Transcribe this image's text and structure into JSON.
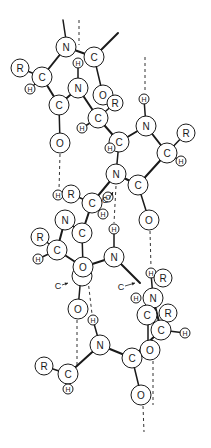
{
  "diagram": {
    "title": "",
    "bond_color": "#1a1a1a",
    "background": "#ffffff"
  },
  "atoms": [
    {
      "id": "n1",
      "label": "N",
      "x": 66,
      "y": 47,
      "r": 10
    },
    {
      "id": "c1",
      "label": "C",
      "x": 94,
      "y": 57,
      "r": 10
    },
    {
      "id": "r1",
      "label": "R",
      "x": 20,
      "y": 68,
      "r": 9
    },
    {
      "id": "ca1",
      "label": "C",
      "x": 42,
      "y": 77,
      "r": 10
    },
    {
      "id": "h1",
      "label": "H",
      "x": 30,
      "y": 89,
      "r": 5
    },
    {
      "id": "h2",
      "label": "H",
      "x": 78,
      "y": 63,
      "r": 5
    },
    {
      "id": "n2",
      "label": "N",
      "x": 78,
      "y": 88,
      "r": 10
    },
    {
      "id": "c2",
      "label": "C",
      "x": 59,
      "y": 105,
      "r": 10
    },
    {
      "id": "o1",
      "label": "O",
      "x": 103,
      "y": 95,
      "r": 10
    },
    {
      "id": "r2",
      "label": "R",
      "x": 115,
      "y": 103,
      "r": 8
    },
    {
      "id": "ca2",
      "label": "C",
      "x": 98,
      "y": 118,
      "r": 10
    },
    {
      "id": "h3",
      "label": "H",
      "x": 82,
      "y": 128,
      "r": 5
    },
    {
      "id": "o2",
      "label": "O",
      "x": 60,
      "y": 143,
      "r": 10
    },
    {
      "id": "c3",
      "label": "C",
      "x": 119,
      "y": 142,
      "r": 10
    },
    {
      "id": "h4",
      "label": "H",
      "x": 110,
      "y": 148,
      "r": 5
    },
    {
      "id": "h5",
      "label": "H",
      "x": 144,
      "y": 99,
      "r": 5
    },
    {
      "id": "n3",
      "label": "N",
      "x": 146,
      "y": 126,
      "r": 10
    },
    {
      "id": "r3",
      "label": "R",
      "x": 186,
      "y": 133,
      "r": 9
    },
    {
      "id": "ca3",
      "label": "C",
      "x": 167,
      "y": 153,
      "r": 10
    },
    {
      "id": "h6",
      "label": "H",
      "x": 181,
      "y": 161,
      "r": 5
    },
    {
      "id": "n4",
      "label": "N",
      "x": 116,
      "y": 174,
      "r": 10
    },
    {
      "id": "c4",
      "label": "C",
      "x": 138,
      "y": 185,
      "r": 10
    },
    {
      "id": "o3",
      "label": "O",
      "x": 149,
      "y": 220,
      "r": 10
    },
    {
      "id": "h7",
      "label": "H",
      "x": 58,
      "y": 195,
      "r": 5
    },
    {
      "id": "r4",
      "label": "R",
      "x": 71,
      "y": 194,
      "r": 9
    },
    {
      "id": "ca4",
      "label": "C",
      "x": 92,
      "y": 203,
      "r": 10
    },
    {
      "id": "o4",
      "label": "O",
      "x": 108,
      "y": 197,
      "r": 5
    },
    {
      "id": "h8",
      "label": "H",
      "x": 103,
      "y": 214,
      "r": 5
    },
    {
      "id": "n5",
      "label": "N",
      "x": 65,
      "y": 220,
      "r": 10
    },
    {
      "id": "c5",
      "label": "C",
      "x": 82,
      "y": 233,
      "r": 10
    },
    {
      "id": "h9",
      "label": "H",
      "x": 114,
      "y": 229,
      "r": 5
    },
    {
      "id": "r5",
      "label": "R",
      "x": 40,
      "y": 237,
      "r": 9
    },
    {
      "id": "ca5",
      "label": "C",
      "x": 57,
      "y": 250,
      "r": 10
    },
    {
      "id": "h10",
      "label": "H",
      "x": 38,
      "y": 259,
      "r": 5
    },
    {
      "id": "n6",
      "label": "N",
      "x": 114,
      "y": 257,
      "r": 10
    },
    {
      "id": "o5b",
      "label": "",
      "x": 82,
      "y": 276,
      "r": 10
    },
    {
      "id": "o5",
      "label": "O",
      "x": 83,
      "y": 267,
      "r": 10
    },
    {
      "id": "h11",
      "label": "H",
      "x": 151,
      "y": 273,
      "r": 5
    },
    {
      "id": "r6",
      "label": "R",
      "x": 163,
      "y": 278,
      "r": 9
    },
    {
      "id": "h12",
      "label": "H",
      "x": 136,
      "y": 298,
      "r": 5
    },
    {
      "id": "n7",
      "label": "N",
      "x": 153,
      "y": 298,
      "r": 10
    },
    {
      "id": "c6",
      "label": "C",
      "x": 147,
      "y": 315,
      "r": 10
    },
    {
      "id": "r7",
      "label": "R",
      "x": 168,
      "y": 313,
      "r": 9
    },
    {
      "id": "ca6",
      "label": "C",
      "x": 161,
      "y": 330,
      "r": 10
    },
    {
      "id": "h13",
      "label": "H",
      "x": 185,
      "y": 333,
      "r": 5
    },
    {
      "id": "o6",
      "label": "O",
      "x": 78,
      "y": 309,
      "r": 10
    },
    {
      "id": "h14",
      "label": "H",
      "x": 93,
      "y": 320,
      "r": 5
    },
    {
      "id": "n8",
      "label": "N",
      "x": 100,
      "y": 345,
      "r": 10
    },
    {
      "id": "o7",
      "label": "O",
      "x": 150,
      "y": 350,
      "r": 10
    },
    {
      "id": "c7",
      "label": "C",
      "x": 132,
      "y": 358,
      "r": 10
    },
    {
      "id": "r8",
      "label": "R",
      "x": 44,
      "y": 366,
      "r": 9
    },
    {
      "id": "ca7",
      "label": "C",
      "x": 68,
      "y": 374,
      "r": 10
    },
    {
      "id": "h15",
      "label": "H",
      "x": 68,
      "y": 389,
      "r": 5
    },
    {
      "id": "o8",
      "label": "O",
      "x": 141,
      "y": 395,
      "r": 10
    }
  ],
  "bonds": [
    {
      "from": [
        63,
        20
      ],
      "to": [
        66,
        40
      ],
      "thick": false
    },
    {
      "from": [
        66,
        47
      ],
      "to": [
        94,
        57
      ],
      "thick": true
    },
    {
      "from": [
        94,
        57
      ],
      "to": [
        118,
        33
      ],
      "thick": true
    },
    {
      "from": [
        66,
        47
      ],
      "to": [
        42,
        77
      ],
      "thick": true
    },
    {
      "from": [
        20,
        68
      ],
      "to": [
        42,
        77
      ],
      "thick": false
    },
    {
      "from": [
        42,
        77
      ],
      "to": [
        30,
        89
      ],
      "thick": false
    },
    {
      "from": [
        42,
        77
      ],
      "to": [
        59,
        105
      ],
      "thick": true
    },
    {
      "from": [
        59,
        105
      ],
      "to": [
        60,
        143
      ],
      "thick": false
    },
    {
      "from": [
        94,
        57
      ],
      "to": [
        103,
        95
      ],
      "thick": false
    },
    {
      "from": [
        78,
        63
      ],
      "to": [
        78,
        88
      ],
      "thick": false
    },
    {
      "from": [
        78,
        88
      ],
      "to": [
        59,
        105
      ],
      "thick": true
    },
    {
      "from": [
        78,
        88
      ],
      "to": [
        98,
        118
      ],
      "thick": true
    },
    {
      "from": [
        98,
        118
      ],
      "to": [
        115,
        103
      ],
      "thick": false
    },
    {
      "from": [
        98,
        118
      ],
      "to": [
        82,
        128
      ],
      "thick": false
    },
    {
      "from": [
        98,
        118
      ],
      "to": [
        119,
        142
      ],
      "thick": true
    },
    {
      "from": [
        119,
        142
      ],
      "to": [
        146,
        126
      ],
      "thick": true
    },
    {
      "from": [
        144,
        99
      ],
      "to": [
        146,
        126
      ],
      "thick": false
    },
    {
      "from": [
        146,
        126
      ],
      "to": [
        167,
        153
      ],
      "thick": true
    },
    {
      "from": [
        167,
        153
      ],
      "to": [
        186,
        133
      ],
      "thick": false
    },
    {
      "from": [
        167,
        153
      ],
      "to": [
        181,
        161
      ],
      "thick": false
    },
    {
      "from": [
        167,
        153
      ],
      "to": [
        138,
        185
      ],
      "thick": true
    },
    {
      "from": [
        119,
        142
      ],
      "to": [
        116,
        174
      ],
      "thick": false
    },
    {
      "from": [
        138,
        185
      ],
      "to": [
        149,
        220
      ],
      "thick": false
    },
    {
      "from": [
        116,
        174
      ],
      "to": [
        138,
        185
      ],
      "thick": true
    },
    {
      "from": [
        116,
        174
      ],
      "to": [
        92,
        203
      ],
      "thick": true
    },
    {
      "from": [
        92,
        203
      ],
      "to": [
        103,
        214
      ],
      "thick": false
    },
    {
      "from": [
        92,
        203
      ],
      "to": [
        71,
        194
      ],
      "thick": false
    },
    {
      "from": [
        92,
        203
      ],
      "to": [
        82,
        233
      ],
      "thick": true
    },
    {
      "from": [
        65,
        220
      ],
      "to": [
        82,
        233
      ],
      "thick": true
    },
    {
      "from": [
        65,
        220
      ],
      "to": [
        57,
        250
      ],
      "thick": true
    },
    {
      "from": [
        82,
        233
      ],
      "to": [
        83,
        267
      ],
      "thick": false
    },
    {
      "from": [
        40,
        237
      ],
      "to": [
        57,
        250
      ],
      "thick": false
    },
    {
      "from": [
        57,
        250
      ],
      "to": [
        38,
        259
      ],
      "thick": false
    },
    {
      "from": [
        57,
        250
      ],
      "to": [
        83,
        267
      ],
      "thick": true
    },
    {
      "from": [
        83,
        267
      ],
      "to": [
        114,
        257
      ],
      "thick": true
    },
    {
      "from": [
        114,
        229
      ],
      "to": [
        114,
        257
      ],
      "thick": false
    },
    {
      "from": [
        114,
        257
      ],
      "to": [
        140,
        283
      ],
      "thick": true
    },
    {
      "from": [
        151,
        273
      ],
      "to": [
        153,
        298
      ],
      "thick": false
    },
    {
      "from": [
        153,
        298
      ],
      "to": [
        161,
        330
      ],
      "thick": true
    },
    {
      "from": [
        161,
        330
      ],
      "to": [
        185,
        333
      ],
      "thick": false
    },
    {
      "from": [
        148,
        323
      ],
      "to": [
        148,
        345
      ],
      "thick": false
    },
    {
      "from": [
        161,
        330
      ],
      "to": [
        132,
        358
      ],
      "thick": true
    },
    {
      "from": [
        78,
        309
      ],
      "to": [
        80,
        286
      ],
      "thick": false
    },
    {
      "from": [
        93,
        320
      ],
      "to": [
        100,
        345
      ],
      "thick": false
    },
    {
      "from": [
        100,
        345
      ],
      "to": [
        132,
        358
      ],
      "thick": true
    },
    {
      "from": [
        100,
        345
      ],
      "to": [
        68,
        374
      ],
      "thick": true
    },
    {
      "from": [
        44,
        366
      ],
      "to": [
        68,
        374
      ],
      "thick": false
    },
    {
      "from": [
        68,
        374
      ],
      "to": [
        68,
        389
      ],
      "thick": false
    },
    {
      "from": [
        132,
        358
      ],
      "to": [
        141,
        395
      ],
      "thick": false
    }
  ],
  "hydrogen_bonds": [
    {
      "from": [
        79,
        20
      ],
      "to": [
        79,
        45
      ]
    },
    {
      "from": [
        145,
        57
      ],
      "to": [
        145,
        93
      ]
    },
    {
      "from": [
        60,
        154
      ],
      "to": [
        59,
        190
      ]
    },
    {
      "from": [
        116,
        186
      ],
      "to": [
        114,
        223
      ]
    },
    {
      "from": [
        150,
        231
      ],
      "to": [
        151,
        267
      ]
    },
    {
      "from": [
        88,
        280
      ],
      "to": [
        92,
        314
      ]
    },
    {
      "from": [
        77,
        320
      ],
      "to": [
        77,
        365
      ]
    },
    {
      "from": [
        153,
        361
      ],
      "to": [
        153,
        405
      ]
    },
    {
      "from": [
        143,
        406
      ],
      "to": [
        144,
        432
      ]
    }
  ],
  "annotations": [
    {
      "text": "C",
      "x": 58,
      "y": 289,
      "arrow_to": [
        68,
        283
      ]
    },
    {
      "text": "C",
      "x": 121,
      "y": 290,
      "arrow_to": [
        135,
        283
      ]
    },
    {
      "text": "C",
      "x": 105,
      "y": 203,
      "arrow_to": [
        113,
        192
      ]
    }
  ]
}
